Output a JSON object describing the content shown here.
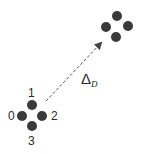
{
  "diagram": {
    "source_cluster": {
      "labels": [
        "0",
        "1",
        "2",
        "3"
      ],
      "dots": [
        {
          "id": "0",
          "cx": 22,
          "cy": 116
        },
        {
          "id": "1",
          "cx": 32,
          "cy": 105
        },
        {
          "id": "2",
          "cx": 42,
          "cy": 116
        },
        {
          "id": "3",
          "cx": 32,
          "cy": 126
        }
      ]
    },
    "target_cluster": {
      "dots": [
        {
          "cx": 117,
          "cy": 16
        },
        {
          "cx": 106,
          "cy": 27
        },
        {
          "cx": 128,
          "cy": 26
        },
        {
          "cx": 116,
          "cy": 37
        }
      ]
    },
    "arrow": {
      "style": "dashed",
      "label_main": "Δ",
      "label_sub": "D"
    },
    "colors": {
      "dot": "#3a3a3a",
      "text": "#2a2a2a",
      "arrow": "#555555"
    }
  }
}
